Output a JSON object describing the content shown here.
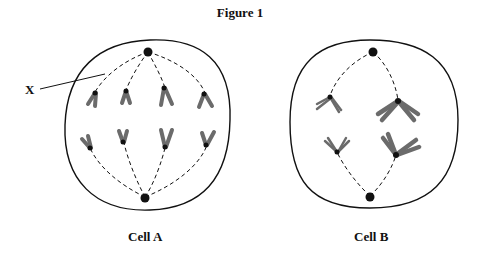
{
  "figure": {
    "title": "Figure 1",
    "pointer_label": "X",
    "cells": [
      {
        "id": "A",
        "label": "Cell A",
        "chromosome_count": 8,
        "stage_hint": "paired chromatids on spindle, 8 chromosomes"
      },
      {
        "id": "B",
        "label": "Cell B",
        "chromosome_count": 4,
        "stage_hint": "4 chromosomes attached to spindle"
      }
    ],
    "colors": {
      "outline": "#111111",
      "chromosome": "#6b6b6b",
      "centromere": "#111111",
      "background": "#ffffff"
    }
  }
}
